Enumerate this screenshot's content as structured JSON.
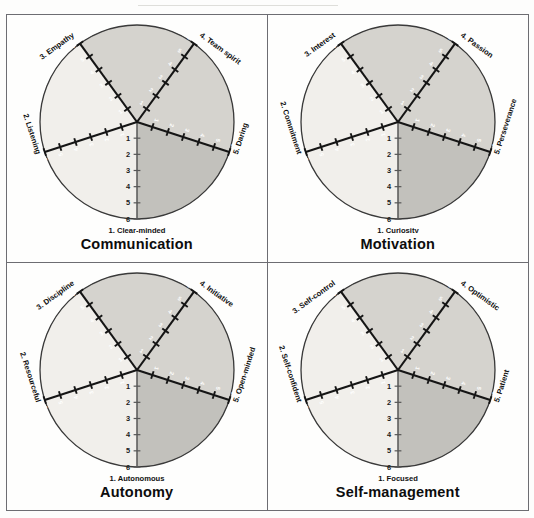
{
  "page": {
    "background_color": "#fdfdfc",
    "frame_color": "#6d6d72",
    "layout": "2x2 grid of competency wheel charts"
  },
  "charts": [
    {
      "title": "Communication",
      "axes": [
        {
          "index": 1,
          "label": "1. Clear-minded",
          "position": "bottom"
        },
        {
          "index": 2,
          "label": "2. Listening",
          "position": "left"
        },
        {
          "index": 3,
          "label": "3. Empathy",
          "position": "upper-left"
        },
        {
          "index": 4,
          "label": "4. Team spirit",
          "position": "upper-right"
        },
        {
          "index": 5,
          "label": "5. Daring",
          "position": "right"
        }
      ]
    },
    {
      "title": "Motivation",
      "axes": [
        {
          "index": 1,
          "label": "1. Curiosity",
          "position": "bottom"
        },
        {
          "index": 2,
          "label": "2. Commitment",
          "position": "left"
        },
        {
          "index": 3,
          "label": "3. Interest",
          "position": "upper-left"
        },
        {
          "index": 4,
          "label": "4. Passion",
          "position": "upper-right"
        },
        {
          "index": 5,
          "label": "5. Perseverance",
          "position": "right"
        }
      ]
    },
    {
      "title": "Autonomy",
      "axes": [
        {
          "index": 1,
          "label": "1. Autonomous",
          "position": "bottom"
        },
        {
          "index": 2,
          "label": "2. Resourceful",
          "position": "left"
        },
        {
          "index": 3,
          "label": "3. Discipline",
          "position": "upper-left"
        },
        {
          "index": 4,
          "label": "4. Initiative",
          "position": "upper-right"
        },
        {
          "index": 5,
          "label": "5. Open-minded",
          "position": "right"
        }
      ]
    },
    {
      "title": "Self-management",
      "axes": [
        {
          "index": 1,
          "label": "1. Focused",
          "position": "bottom"
        },
        {
          "index": 2,
          "label": "2. Self-confident",
          "position": "left"
        },
        {
          "index": 3,
          "label": "3. Self-control",
          "position": "upper-left"
        },
        {
          "index": 4,
          "label": "4. Optimistic",
          "position": "upper-right"
        },
        {
          "index": 5,
          "label": "5. Patient",
          "position": "right"
        }
      ]
    }
  ],
  "chart_data": [
    {
      "type": "radar",
      "title": "Communication",
      "categories": [
        "1. Clear-minded",
        "2. Listening",
        "3. Empathy",
        "4. Team spirit",
        "5. Daring"
      ],
      "scale_ticks": [
        1,
        2,
        3,
        4,
        5,
        6
      ],
      "scale_direction": "center=1 to edge=6",
      "axis_angles_deg": [
        270,
        198,
        126,
        54,
        342
      ],
      "sector_count": 10,
      "sector_grays": [
        "#eeece8",
        "#d4d2cd",
        "#c3c2bd",
        "#a9a8a3",
        "#8e8d89",
        "#9b9a95",
        "#7d7c78",
        "#616060",
        "#4a4a49",
        "#e3e1dc"
      ],
      "legend": "none",
      "grid": true,
      "values": []
    },
    {
      "type": "radar",
      "title": "Motivation",
      "categories": [
        "1. Curiosity",
        "2. Commitment",
        "3. Interest",
        "4. Passion",
        "5. Perseverance"
      ],
      "scale_ticks": [
        1,
        2,
        3,
        4,
        5,
        6
      ],
      "scale_direction": "center=1 to edge=6",
      "axis_angles_deg": [
        270,
        198,
        126,
        54,
        342
      ],
      "sector_count": 10,
      "legend": "none",
      "grid": true,
      "values": []
    },
    {
      "type": "radar",
      "title": "Autonomy",
      "categories": [
        "1. Autonomous",
        "2. Resourceful",
        "3. Discipline",
        "4. Initiative",
        "5. Open-minded"
      ],
      "scale_ticks": [
        1,
        2,
        3,
        4,
        5,
        6
      ],
      "scale_direction": "center=1 to edge=6",
      "axis_angles_deg": [
        270,
        198,
        126,
        54,
        342
      ],
      "sector_count": 10,
      "legend": "none",
      "grid": true,
      "values": []
    },
    {
      "type": "radar",
      "title": "Self-management",
      "categories": [
        "1. Focused",
        "2. Self-confident",
        "3. Self-control",
        "4. Optimistic",
        "5. Patient"
      ],
      "scale_ticks": [
        1,
        2,
        3,
        4,
        5,
        6
      ],
      "scale_direction": "center=1 to edge=6",
      "axis_angles_deg": [
        270,
        198,
        126,
        54,
        342
      ],
      "sector_count": 10,
      "legend": "none",
      "grid": true,
      "values": []
    }
  ]
}
